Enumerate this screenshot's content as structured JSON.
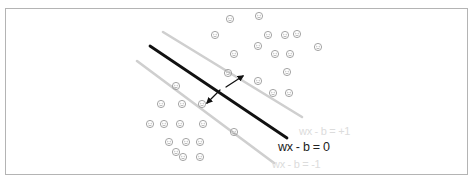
{
  "diagram": {
    "type": "svm-margin-illustration",
    "labels": {
      "hyperplane": "wx - b = 0",
      "positive_margin": "wx - b = +1",
      "negative_margin": "wx - b = -1"
    },
    "colors": {
      "hyperplane": "#111111",
      "margin_lines": "#cfcfcf",
      "points": "#9a9a9a",
      "frame": "#b4b4b4"
    },
    "lines": {
      "hyperplane": {
        "x1": 150,
        "y1": 46,
        "x2": 287,
        "y2": 138
      },
      "upper_margin": {
        "x1": 163,
        "y1": 32,
        "x2": 302,
        "y2": 117
      },
      "lower_margin": {
        "x1": 137,
        "y1": 61,
        "x2": 274,
        "y2": 163
      }
    },
    "arrows": [
      {
        "x1": 226,
        "y1": 87,
        "x2": 243,
        "y2": 76
      },
      {
        "x1": 220,
        "y1": 90,
        "x2": 207,
        "y2": 103
      }
    ],
    "upper_class_points": [
      [
        230,
        19
      ],
      [
        259,
        16
      ],
      [
        215,
        35
      ],
      [
        268,
        35
      ],
      [
        285,
        35
      ],
      [
        318,
        47
      ],
      [
        234,
        54
      ],
      [
        258,
        46
      ],
      [
        275,
        54
      ],
      [
        290,
        54
      ],
      [
        297,
        34
      ],
      [
        287,
        72
      ],
      [
        289,
        93
      ],
      [
        258,
        81
      ],
      [
        273,
        93
      ],
      [
        228,
        73
      ]
    ],
    "lower_class_points": [
      [
        176,
        86
      ],
      [
        161,
        104
      ],
      [
        182,
        104
      ],
      [
        202,
        104
      ],
      [
        150,
        124
      ],
      [
        164,
        124
      ],
      [
        180,
        124
      ],
      [
        203,
        124
      ],
      [
        234,
        132
      ],
      [
        169,
        142
      ],
      [
        186,
        142
      ],
      [
        200,
        142
      ],
      [
        176,
        152
      ],
      [
        183,
        157
      ],
      [
        200,
        157
      ]
    ]
  }
}
